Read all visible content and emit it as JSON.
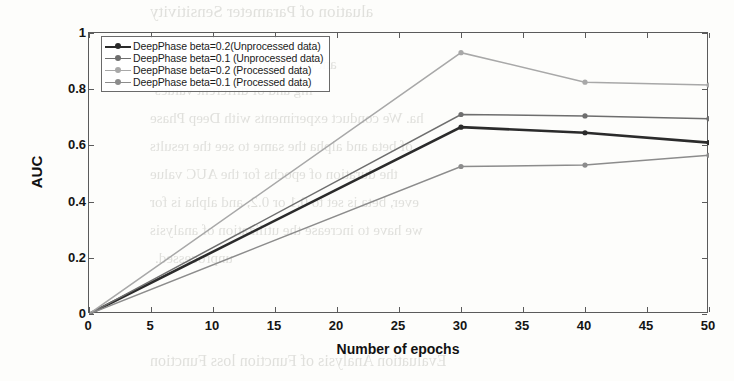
{
  "chart_data": {
    "type": "line",
    "title": "",
    "xlabel": "Number of epochs",
    "ylabel": "AUC",
    "xlim": [
      0,
      50
    ],
    "ylim": [
      0,
      1
    ],
    "xticks": [
      0,
      5,
      10,
      15,
      20,
      25,
      30,
      35,
      40,
      45,
      50
    ],
    "yticks": [
      0,
      0.2,
      0.4,
      0.6,
      0.8,
      1
    ],
    "grid": false,
    "legend_position": "top-left",
    "x": [
      0,
      30,
      40,
      50
    ],
    "series": [
      {
        "name": "DeepPhase beta=0.2(Unprocessed data)",
        "values": [
          0,
          0.665,
          0.645,
          0.61
        ],
        "color": "#2b2b2b",
        "width": 2.6
      },
      {
        "name": "DeepPhase beta=0.1 (Unprocessed data)",
        "values": [
          0,
          0.71,
          0.705,
          0.695
        ],
        "color": "#6e6e6e",
        "width": 1.5
      },
      {
        "name": "DeepPhase beta=0.2 (Processed data)",
        "values": [
          0,
          0.93,
          0.825,
          0.815
        ],
        "color": "#a8a8a8",
        "width": 1.5
      },
      {
        "name": "DeepPhase beta=0.1 (Processed data)",
        "values": [
          0,
          0.525,
          0.53,
          0.565
        ],
        "color": "#8c8c8c",
        "width": 1.5
      }
    ]
  },
  "background_ghost_text": [
    {
      "text": "aluation of Parameter Sensitivity",
      "x": 150,
      "y": 2,
      "size": 17
    },
    {
      "text": "ant loss from the transmitting",
      "x": 160,
      "y": 56,
      "size": 15
    },
    {
      "text": "ing and of different values",
      "x": 155,
      "y": 82,
      "size": 15
    },
    {
      "text": "ha. We conduct experiments with Deep Phase",
      "x": 150,
      "y": 110,
      "size": 15
    },
    {
      "text": "of beta and alpha the same to see the results",
      "x": 150,
      "y": 138,
      "size": 15
    },
    {
      "text": "the duration of epochs for the AUC value",
      "x": 150,
      "y": 166,
      "size": 15
    },
    {
      "text": "ever, beta is set to 0.1 or 0.2, and alpha is for",
      "x": 150,
      "y": 194,
      "size": 15
    },
    {
      "text": "we have to increase the utilization of analysis",
      "x": 150,
      "y": 222,
      "size": 15
    },
    {
      "text": "unprocessed.",
      "x": 155,
      "y": 250,
      "size": 15
    },
    {
      "text": "Evaluation Analysis of Function loss Function",
      "x": 150,
      "y": 352,
      "size": 16
    }
  ]
}
